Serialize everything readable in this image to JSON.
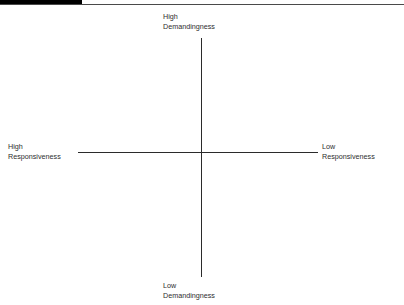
{
  "page": {
    "background": "#ffffff",
    "width": 404,
    "height": 305
  },
  "header": {
    "tab_block_color": "#000000",
    "rule_color": "#4a4a4a",
    "title": ""
  },
  "diagram": {
    "type": "two-axis-quadrant",
    "axis_color": "#2b2b2b",
    "center": {
      "x": 201,
      "y": 152
    },
    "vertical_axis": {
      "top": 38,
      "bottom": 277
    },
    "horizontal_axis": {
      "left": 78,
      "right": 318
    },
    "labels": {
      "top": {
        "line1": "High",
        "line2": "Demandingness"
      },
      "bottom": {
        "line1": "Low",
        "line2": "Demandingness"
      },
      "left": {
        "line1": "High",
        "line2": "Responsiveness"
      },
      "right": {
        "line1": "Low",
        "line2": "Responsiveness"
      }
    }
  }
}
